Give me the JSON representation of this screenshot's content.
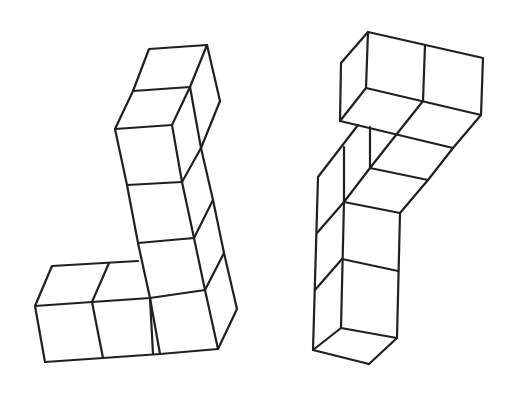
{
  "figure": {
    "description": "Two isometric line drawings of polycube structures made of unit cubes",
    "stroke_color": "#231f1c",
    "background_color": "#ffffff",
    "shapes": [
      {
        "id": "left-structure",
        "label": "L-shaped tower of cubes",
        "cube_count": 7,
        "description": "Vertical column of five cubes with two additional cubes extending left at the base"
      },
      {
        "id": "right-structure",
        "label": "Bent structure of cubes",
        "cube_count": 6,
        "description": "Three-cube vertical column with an upper horizontal arm of cubes leaning back and to the right"
      }
    ]
  }
}
